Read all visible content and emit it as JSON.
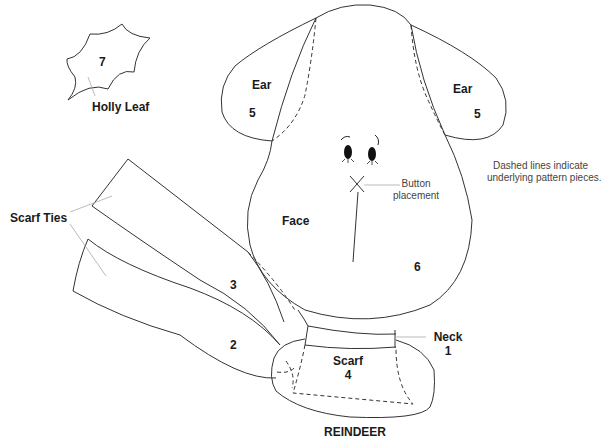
{
  "title": "REINDEER",
  "note": {
    "line1": "Dashed lines indicate",
    "line2": "underlying pattern pieces."
  },
  "pieces": {
    "holly_leaf": {
      "number": "7",
      "label": "Holly Leaf"
    },
    "ear_left": {
      "label": "Ear",
      "number": "5"
    },
    "ear_right": {
      "label": "Ear",
      "number": "5"
    },
    "face": {
      "label": "Face",
      "number": "6"
    },
    "button": {
      "line1": "Button",
      "line2": "placement"
    },
    "scarf_ties": {
      "label": "Scarf Ties",
      "upper_number": "3",
      "lower_number": "2"
    },
    "neck": {
      "label": "Neck",
      "number": "1"
    },
    "scarf": {
      "label": "Scarf",
      "number": "4"
    }
  },
  "colors": {
    "outline": "#333333",
    "leader": "#aaaaaa",
    "text": "#1a1a1a"
  }
}
